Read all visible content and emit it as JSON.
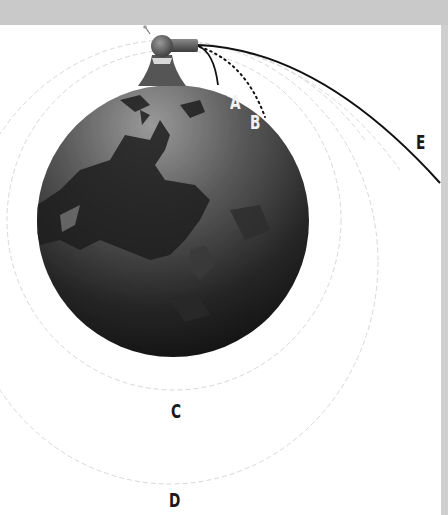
{
  "diagram": {
    "colors": {
      "background": "#ffffff",
      "frame_band": "#c9c9c9",
      "planet_light": "#8a8a8a",
      "planet_dark": "#141414",
      "trajectory": "#111111",
      "orbit_guides": "#d6d6d6"
    },
    "labels": {
      "a": "A",
      "b": "B",
      "c": "C",
      "d": "D",
      "e": "E"
    },
    "elements": {
      "planet": "earth-globe",
      "cannon": "cannon-on-mountain",
      "trajectories": [
        {
          "label": "A",
          "style": "solid",
          "result": "falls near mountain"
        },
        {
          "label": "B",
          "style": "dotted",
          "result": "falls farther away"
        },
        {
          "label": "C",
          "style": "faint dashed",
          "result": "circular orbit"
        },
        {
          "label": "D",
          "style": "faint dashed",
          "result": "elliptical orbit"
        },
        {
          "label": "E",
          "style": "solid",
          "result": "escapes"
        }
      ]
    }
  }
}
